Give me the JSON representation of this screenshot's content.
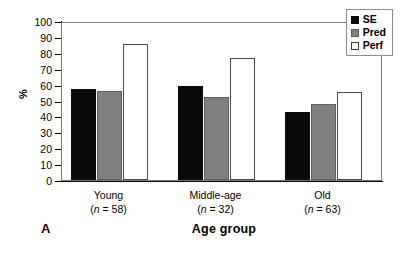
{
  "panel": {
    "letter": "A"
  },
  "legend": {
    "entries": [
      {
        "label": "SE",
        "color": "#0a0a0a",
        "swatch": "se"
      },
      {
        "label": "Pred",
        "color": "#808080",
        "swatch": "pred"
      },
      {
        "label": "Perf",
        "color": "#ffffff",
        "swatch": "perf"
      }
    ]
  },
  "axes": {
    "ylabel": "%",
    "xlabel": "Age group",
    "yticks": [
      0,
      10,
      20,
      30,
      40,
      50,
      60,
      70,
      80,
      90,
      100
    ]
  },
  "categories_detail": [
    {
      "name": "Young",
      "n_prefix": "(",
      "n_symbol": "n",
      "n_text": " = 58)"
    },
    {
      "name": "Middle-age",
      "n_prefix": "(",
      "n_symbol": "n",
      "n_text": " = 32)"
    },
    {
      "name": "Old",
      "n_prefix": "(",
      "n_symbol": "n",
      "n_text": " = 63)"
    }
  ],
  "chart_data": {
    "type": "bar",
    "title": "",
    "subtitle": "",
    "xlabel": "Age group",
    "ylabel": "%",
    "ylim": [
      0,
      100
    ],
    "ytick_step": 10,
    "grid": false,
    "legend_position": "top-right",
    "categories": [
      "Young",
      "Middle-age",
      "Old"
    ],
    "category_labels": [
      "Young (n = 58)",
      "Middle-age (n = 32)",
      "Old (n = 63)"
    ],
    "group_sizes": [
      58,
      32,
      63
    ],
    "series": [
      {
        "name": "SE",
        "color": "#0a0a0a",
        "values": [
          57.5,
          59.0,
          43.0
        ]
      },
      {
        "name": "Pred",
        "color": "#808080",
        "values": [
          56.0,
          52.0,
          47.5
        ]
      },
      {
        "name": "Perf",
        "color": "#ffffff",
        "values": [
          85.5,
          76.5,
          55.5
        ]
      }
    ],
    "annotations": [
      "A"
    ]
  }
}
